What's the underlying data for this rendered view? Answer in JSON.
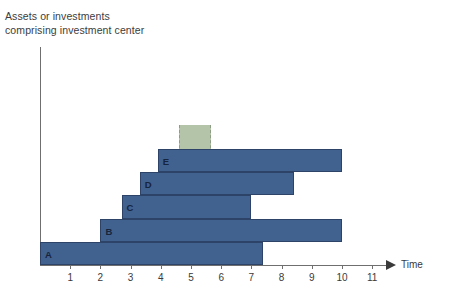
{
  "chart_data": {
    "type": "bar",
    "orientation": "horizontal",
    "title": "Assets or investments\ncomprising investment center",
    "ylabel": "Assets or investments comprising investment center",
    "xlabel": "Time",
    "xlim": [
      0,
      11.6
    ],
    "xticks": [
      1,
      2,
      3,
      4,
      5,
      6,
      7,
      8,
      9,
      10,
      11
    ],
    "grid": false,
    "legend": null,
    "categories": [
      "A",
      "B",
      "C",
      "D",
      "E"
    ],
    "bars": [
      {
        "label": "E",
        "start": 3.9,
        "end": 10.0,
        "row": 0
      },
      {
        "label": "D",
        "start": 3.3,
        "end": 8.4,
        "row": 1
      },
      {
        "label": "C",
        "start": 2.7,
        "end": 7.0,
        "row": 2
      },
      {
        "label": "B",
        "start": 2.0,
        "end": 10.0,
        "row": 3
      },
      {
        "label": "A",
        "start": 0.0,
        "end": 7.4,
        "row": 4
      }
    ],
    "highlight_band": {
      "start": 4.6,
      "end": 5.6,
      "label": ""
    },
    "colors": {
      "bar": "#41618f",
      "bar_border": "#2d4367",
      "band": "#b3c4a8",
      "band_border": "#8d9c84",
      "axis": "#6f6f6f",
      "text": "#3a3a3a",
      "background": "#ffffff"
    }
  }
}
